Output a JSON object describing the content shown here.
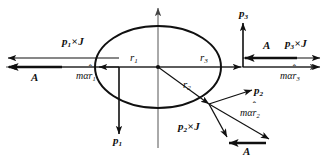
{
  "figure": {
    "type": "vector-diagram",
    "colors": {
      "stroke": "#101010",
      "axis": "#555555",
      "background": "#ffffff",
      "text": "#101010"
    },
    "ellipse": {
      "cx": 158,
      "cy": 67,
      "rx": 63,
      "ry": 41
    },
    "origin": {
      "x": 158,
      "y": 67
    }
  },
  "labels": {
    "p1_cross_J": {
      "p": "p",
      "sub": "1",
      "times": "×",
      "J": "J"
    },
    "p2_cross_J": {
      "p": "p",
      "sub": "2",
      "times": "×",
      "J": "J"
    },
    "p3_cross_J": {
      "p": "p",
      "sub": "3",
      "times": "×",
      "J": "J"
    },
    "A_left": "A",
    "A_right": "A",
    "A_bottom": "A",
    "ma_r1": {
      "m": "m",
      "alpha": "α",
      "r": "r",
      "hat": "ˆ",
      "sub": "1"
    },
    "ma_r2": {
      "m": "m",
      "alpha": "α",
      "r": "r",
      "hat": "ˆ",
      "sub": "2"
    },
    "ma_r3": {
      "m": "m",
      "alpha": "α",
      "r": "r",
      "hat": "ˆ",
      "sub": "3"
    },
    "r1": {
      "r": "r",
      "sub": "1"
    },
    "r2": {
      "r": "r",
      "sub": "2"
    },
    "r3": {
      "r": "r",
      "sub": "3"
    },
    "p1": {
      "p": "p",
      "sub": "1"
    },
    "p2": {
      "p": "p",
      "sub": "2"
    },
    "p3": {
      "p": "p",
      "sub": "3"
    }
  }
}
